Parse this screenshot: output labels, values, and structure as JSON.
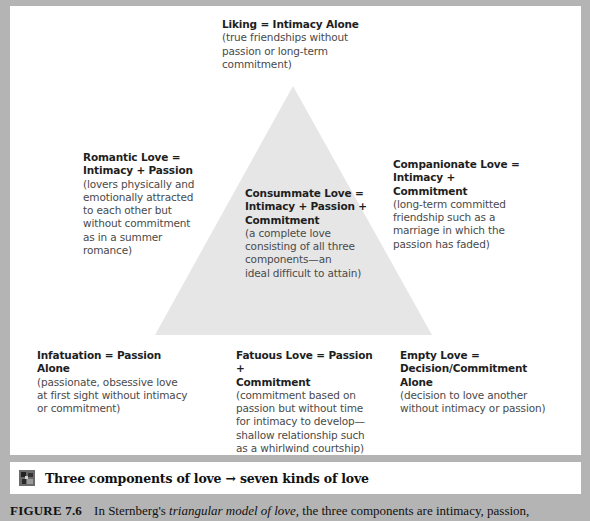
{
  "diagram": {
    "title": "Sternberg's triangular model of love",
    "shape": "triangle",
    "colors": {
      "frame": "#b4b4b4",
      "panel": "#ffffff",
      "triangle_fill": "#e6e6e6",
      "title_text": "#1e1e1e",
      "desc_text": "#4a4a4a"
    },
    "nodes": {
      "liking": {
        "title": "Liking = Intimacy Alone",
        "desc": "(true friendships without\npassion or long-term\ncommitment)"
      },
      "romantic": {
        "title": "Romantic Love =\nIntimacy + Passion",
        "desc": "(lovers physically and\nemotionally attracted\nto each other but\nwithout commitment\nas in a summer romance)"
      },
      "consummate": {
        "title": "Consummate Love =\nIntimacy + Passion +\nCommitment",
        "desc": "(a complete love\nconsisting of all three\ncomponents—an\nideal difficult to attain)"
      },
      "companionate": {
        "title": "Companionate Love =\nIntimacy +\nCommitment",
        "desc": "(long-term committed\nfriendship such as a\nmarriage in which the\npassion has faded)"
      },
      "infatuation": {
        "title": "Infatuation = Passion Alone",
        "desc": "(passionate, obsessive love\nat first sight without intimacy\nor commitment)"
      },
      "fatuous": {
        "title": "Fatuous Love = Passion +\nCommitment",
        "desc": "(commitment based on\npassion but without time\nfor intimacy to develop—\nshallow relationship such\nas a whirlwind courtship)"
      },
      "empty": {
        "title": "Empty Love =\nDecision/Commitment\nAlone",
        "desc": "(decision to love another\nwithout intimacy or passion)"
      }
    }
  },
  "caption_band": {
    "icon": "concept-map-icon",
    "text": "Three components of love → seven kinds of love"
  },
  "figure_caption": {
    "number": "FIGURE 7.6",
    "text_before": "In Sternberg's ",
    "italic": "triangular model of love,",
    "text_after": " the three components are intimacy, passion,"
  }
}
